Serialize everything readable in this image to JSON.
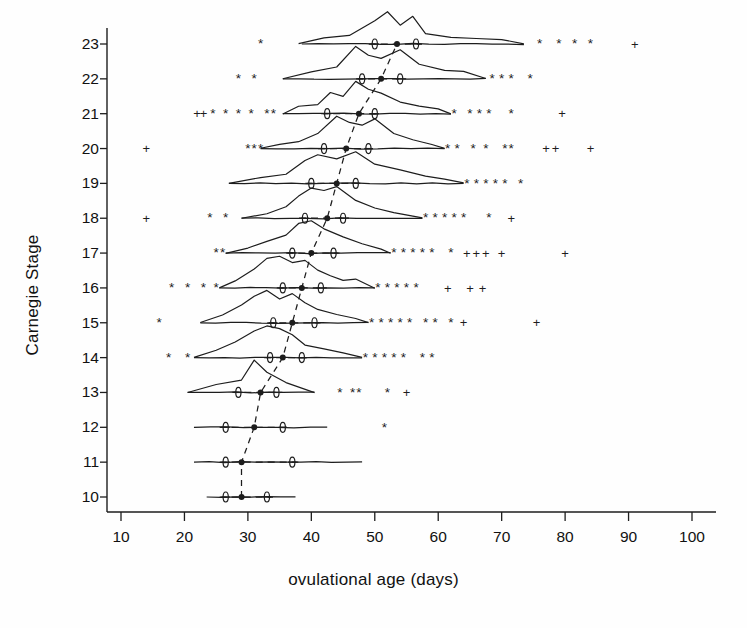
{
  "chart_data": {
    "type": "line",
    "subtype": "ridgeline-density-with-boxplot-summary",
    "title": "",
    "xlabel": "ovulational age (days)",
    "ylabel": "Carnegie Stage",
    "xlim": [
      8,
      103
    ],
    "ylim": [
      9.4,
      23.6
    ],
    "xticks": [
      10,
      20,
      30,
      40,
      50,
      60,
      70,
      80,
      90,
      100
    ],
    "xtick_labels": [
      "10",
      "20",
      "30",
      "40",
      "50",
      "60",
      "70",
      "80",
      "90",
      "100"
    ],
    "yticks": [
      10,
      11,
      12,
      13,
      14,
      15,
      16,
      17,
      18,
      19,
      20,
      21,
      22,
      23
    ],
    "ytick_labels": [
      "10",
      "11",
      "12",
      "13",
      "14",
      "15",
      "16",
      "17",
      "18",
      "19",
      "20",
      "21",
      "22",
      "23"
    ],
    "grid": false,
    "legend": null,
    "marker_glyphs": {
      "median": "filled-dot",
      "quartile": "theta-oval",
      "outlier_star": "*",
      "outlier_plus": "+"
    },
    "connector": {
      "name": "median-trend-line",
      "style": "dashed",
      "points": [
        [
          29.0,
          10
        ],
        [
          29.0,
          11
        ],
        [
          31.0,
          12
        ],
        [
          32.0,
          13
        ],
        [
          35.5,
          14
        ],
        [
          37.0,
          15
        ],
        [
          38.5,
          16
        ],
        [
          40.0,
          17
        ],
        [
          42.5,
          18
        ],
        [
          44.0,
          19
        ],
        [
          45.5,
          20
        ],
        [
          47.5,
          21
        ],
        [
          51.0,
          22
        ],
        [
          53.5,
          23
        ]
      ]
    },
    "series": [
      {
        "name": "Stage 23",
        "stage": 23,
        "whisker": [
          38.5,
          73.5
        ],
        "q1": 50.0,
        "median": 53.5,
        "q3": 56.5,
        "density": [
          [
            38,
            0
          ],
          [
            42,
            0.06
          ],
          [
            46,
            0.08
          ],
          [
            50,
            0.22
          ],
          [
            52,
            0.3
          ],
          [
            54,
            0.18
          ],
          [
            56,
            0.26
          ],
          [
            58,
            0.1
          ],
          [
            62,
            0.06
          ],
          [
            66,
            0.05
          ],
          [
            70,
            0.04
          ],
          [
            73.5,
            0
          ]
        ],
        "outliers_star": [
          32.0,
          76.0,
          79.0,
          81.5,
          84.0
        ],
        "outliers_plus": [
          91.0
        ]
      },
      {
        "name": "Stage 22",
        "stage": 22,
        "whisker": [
          35.5,
          67.5
        ],
        "q1": 48.0,
        "median": 51.0,
        "q3": 54.0,
        "density": [
          [
            35.5,
            0
          ],
          [
            40,
            0.05
          ],
          [
            44,
            0.08
          ],
          [
            47,
            0.22
          ],
          [
            49,
            0.16
          ],
          [
            51,
            0.14
          ],
          [
            54,
            0.2
          ],
          [
            57,
            0.1
          ],
          [
            61,
            0.06
          ],
          [
            64,
            0.05
          ],
          [
            67.5,
            0
          ]
        ],
        "outliers_star": [
          28.5,
          31.0,
          68.5,
          70.0,
          71.5,
          74.5
        ],
        "outliers_plus": []
      },
      {
        "name": "Stage 21",
        "stage": 21,
        "whisker": [
          35.5,
          62.0
        ],
        "q1": 42.5,
        "median": 47.5,
        "q3": 50.0,
        "density": [
          [
            35.5,
            0
          ],
          [
            38,
            0.08
          ],
          [
            41,
            0.1
          ],
          [
            43,
            0.22
          ],
          [
            45,
            0.18
          ],
          [
            47,
            0.34
          ],
          [
            49,
            0.26
          ],
          [
            51,
            0.22
          ],
          [
            54,
            0.12
          ],
          [
            57,
            0.08
          ],
          [
            60,
            0.05
          ],
          [
            62,
            0
          ]
        ],
        "outliers_star": [
          24.5,
          26.5,
          28.5,
          30.5,
          33.0,
          34.0,
          62.5,
          65.0,
          66.5,
          68.0,
          71.5
        ],
        "outliers_plus": [
          22.0,
          23.0,
          79.5
        ]
      },
      {
        "name": "Stage 20",
        "stage": 20,
        "whisker": [
          32.0,
          61.0
        ],
        "q1": 42.0,
        "median": 45.5,
        "q3": 49.0,
        "density": [
          [
            32,
            0
          ],
          [
            35,
            0.06
          ],
          [
            38,
            0.1
          ],
          [
            41,
            0.22
          ],
          [
            44,
            0.46
          ],
          [
            46,
            0.38
          ],
          [
            48,
            0.34
          ],
          [
            50,
            0.42
          ],
          [
            53,
            0.22
          ],
          [
            56,
            0.12
          ],
          [
            59,
            0.06
          ],
          [
            61,
            0
          ]
        ],
        "outliers_star": [
          30.0,
          31.0,
          32.0,
          61.5,
          63.0,
          65.5,
          67.5,
          70.5,
          71.5
        ],
        "outliers_plus": [
          14.0,
          77.0,
          78.5,
          84.0
        ]
      },
      {
        "name": "Stage 19",
        "stage": 19,
        "whisker": [
          27.0,
          64.0
        ],
        "q1": 40.0,
        "median": 44.0,
        "q3": 47.0,
        "density": [
          [
            27,
            0
          ],
          [
            32,
            0.06
          ],
          [
            36,
            0.1
          ],
          [
            39,
            0.24
          ],
          [
            41,
            0.3
          ],
          [
            44,
            0.26
          ],
          [
            47,
            0.34
          ],
          [
            50,
            0.2
          ],
          [
            54,
            0.14
          ],
          [
            58,
            0.08
          ],
          [
            61,
            0.05
          ],
          [
            64,
            0
          ]
        ],
        "outliers_star": [
          64.5,
          66.0,
          67.5,
          69.0,
          70.5,
          73.0
        ],
        "outliers_plus": []
      },
      {
        "name": "Stage 18",
        "stage": 18,
        "whisker": [
          29.0,
          57.5
        ],
        "q1": 39.0,
        "median": 42.5,
        "q3": 45.0,
        "density": [
          [
            29,
            0
          ],
          [
            33,
            0.06
          ],
          [
            36,
            0.16
          ],
          [
            38,
            0.3
          ],
          [
            40,
            0.42
          ],
          [
            42,
            0.38
          ],
          [
            44,
            0.44
          ],
          [
            47,
            0.24
          ],
          [
            50,
            0.14
          ],
          [
            53,
            0.08
          ],
          [
            57.5,
            0
          ]
        ],
        "outliers_star": [
          24.0,
          26.5,
          58.0,
          59.5,
          61.0,
          62.5,
          64.0,
          68.0
        ],
        "outliers_plus": [
          14.0,
          71.5
        ]
      },
      {
        "name": "Stage 17",
        "stage": 17,
        "whisker": [
          26.5,
          52.5
        ],
        "q1": 37.0,
        "median": 40.0,
        "q3": 43.5,
        "density": [
          [
            26.5,
            0
          ],
          [
            30,
            0.1
          ],
          [
            33,
            0.22
          ],
          [
            36,
            0.34
          ],
          [
            38,
            0.58
          ],
          [
            40,
            0.62
          ],
          [
            42,
            0.46
          ],
          [
            45,
            0.32
          ],
          [
            48,
            0.18
          ],
          [
            51,
            0.08
          ],
          [
            52.5,
            0
          ]
        ],
        "outliers_star": [
          25.0,
          26.0,
          53.0,
          54.5,
          56.0,
          57.5,
          59.0,
          62.0
        ],
        "outliers_plus": [
          64.5,
          66.0,
          67.5,
          70.0,
          80.0
        ]
      },
      {
        "name": "Stage 16",
        "stage": 16,
        "whisker": [
          25.5,
          50.0
        ],
        "q1": 35.5,
        "median": 38.5,
        "q3": 41.5,
        "density": [
          [
            25.5,
            0
          ],
          [
            28,
            0.2
          ],
          [
            31,
            0.52
          ],
          [
            33,
            0.82
          ],
          [
            35,
            0.9
          ],
          [
            37,
            0.72
          ],
          [
            39,
            0.78
          ],
          [
            41,
            0.5
          ],
          [
            43,
            0.34
          ],
          [
            45,
            0.22
          ],
          [
            47,
            0.26
          ],
          [
            50,
            0
          ]
        ],
        "outliers_star": [
          18.0,
          20.5,
          23.0,
          25.0,
          50.5,
          52.0,
          53.5,
          55.0,
          56.5
        ],
        "outliers_plus": [
          61.5,
          65.0,
          67.0
        ]
      },
      {
        "name": "Stage 15",
        "stage": 15,
        "whisker": [
          22.5,
          49.0
        ],
        "q1": 34.0,
        "median": 37.0,
        "q3": 40.5,
        "density": [
          [
            22.5,
            0
          ],
          [
            26,
            0.18
          ],
          [
            29,
            0.4
          ],
          [
            31,
            0.6
          ],
          [
            33,
            0.72
          ],
          [
            35,
            0.54
          ],
          [
            37,
            0.66
          ],
          [
            39,
            0.44
          ],
          [
            41,
            0.3
          ],
          [
            44,
            0.18
          ],
          [
            47,
            0.1
          ],
          [
            49,
            0
          ]
        ],
        "outliers_star": [
          16.0,
          49.5,
          51.0,
          52.5,
          54.0,
          55.5,
          58.0,
          59.5,
          62.0
        ],
        "outliers_plus": [
          64.0,
          75.5
        ]
      },
      {
        "name": "Stage 14",
        "stage": 14,
        "whisker": [
          21.5,
          48.0
        ],
        "q1": 33.5,
        "median": 35.5,
        "q3": 38.5,
        "density": [
          [
            21.5,
            0
          ],
          [
            25,
            0.16
          ],
          [
            28,
            0.36
          ],
          [
            31,
            0.62
          ],
          [
            33,
            0.74
          ],
          [
            35,
            0.66
          ],
          [
            37,
            0.52
          ],
          [
            39,
            0.3
          ],
          [
            42,
            0.2
          ],
          [
            45,
            0.1
          ],
          [
            48,
            0
          ]
        ],
        "outliers_star": [
          17.5,
          20.5,
          48.5,
          50.0,
          51.5,
          53.0,
          54.5,
          57.5,
          59.0
        ],
        "outliers_plus": []
      },
      {
        "name": "Stage 13",
        "stage": 13,
        "whisker": [
          20.5,
          40.5
        ],
        "q1": 28.5,
        "median": 32.0,
        "q3": 34.5,
        "density": [
          [
            20.5,
            0
          ],
          [
            25,
            0.04
          ],
          [
            29,
            0.06
          ],
          [
            31,
            0.16
          ],
          [
            33,
            0.1
          ],
          [
            36,
            0.05
          ],
          [
            40.5,
            0
          ]
        ],
        "outliers_star": [
          44.5,
          46.5,
          47.5,
          52.0
        ],
        "outliers_plus": [
          55.0
        ]
      },
      {
        "name": "Stage 12",
        "stage": 12,
        "whisker": [
          21.5,
          42.5
        ],
        "q1": 26.5,
        "median": 31.0,
        "q3": 35.5,
        "density": [
          [
            21.5,
            0
          ],
          [
            42.5,
            0
          ]
        ],
        "outliers_star": [
          51.5
        ],
        "outliers_plus": []
      },
      {
        "name": "Stage 11",
        "stage": 11,
        "whisker": [
          21.5,
          48.0
        ],
        "q1": 26.5,
        "median": 29.0,
        "q3": 37.0,
        "density": [
          [
            21.5,
            0
          ],
          [
            48,
            0
          ]
        ],
        "outliers_star": [],
        "outliers_plus": []
      },
      {
        "name": "Stage 10",
        "stage": 10,
        "whisker": [
          23.5,
          37.5
        ],
        "q1": 26.5,
        "median": 29.0,
        "q3": 33.0,
        "density": [
          [
            23.5,
            0
          ],
          [
            37.5,
            0
          ]
        ],
        "outliers_star": [],
        "outliers_plus": []
      }
    ]
  },
  "figure": {
    "x_axis_title": "ovulational age (days)",
    "y_axis_title": "Carnegie Stage"
  }
}
